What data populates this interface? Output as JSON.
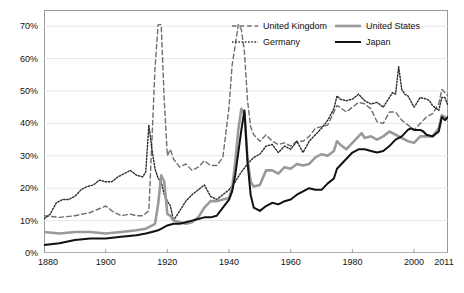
{
  "chart_data": {
    "type": "line",
    "title": "",
    "subtitle": "",
    "xlabel": "",
    "ylabel": "",
    "xlim": [
      1880,
      2011
    ],
    "ylim": [
      0,
      75
    ],
    "grid": false,
    "legend_position": "top-right",
    "xticks": [
      "1880",
      "1900",
      "1920",
      "1940",
      "1960",
      "1980",
      "2000",
      "2011"
    ],
    "xtick_values": [
      1880,
      1900,
      1920,
      1940,
      1960,
      1980,
      2000,
      2011
    ],
    "yticks": [
      "0%",
      "10%",
      "20%",
      "30%",
      "40%",
      "50%",
      "60%",
      "70%"
    ],
    "ytick_values": [
      0,
      10,
      20,
      30,
      40,
      50,
      60,
      70
    ],
    "series": [
      {
        "name": "United Kingdom",
        "color": "#6e6e6e",
        "style": "dashed",
        "width": 1.4,
        "points": [
          [
            1880,
            11.5
          ],
          [
            1885,
            11.0
          ],
          [
            1890,
            11.5
          ],
          [
            1895,
            12.5
          ],
          [
            1900,
            14.5
          ],
          [
            1902,
            13.0
          ],
          [
            1905,
            11.5
          ],
          [
            1908,
            12.0
          ],
          [
            1910,
            11.5
          ],
          [
            1912,
            11.5
          ],
          [
            1914,
            13.0
          ],
          [
            1915,
            35.0
          ],
          [
            1916,
            57.0
          ],
          [
            1917,
            70.5
          ],
          [
            1918,
            70.5
          ],
          [
            1919,
            47.0
          ],
          [
            1920,
            30.0
          ],
          [
            1921,
            32.0
          ],
          [
            1922,
            29.0
          ],
          [
            1924,
            26.5
          ],
          [
            1926,
            27.5
          ],
          [
            1928,
            25.5
          ],
          [
            1930,
            26.5
          ],
          [
            1932,
            28.5
          ],
          [
            1934,
            27.0
          ],
          [
            1936,
            27.0
          ],
          [
            1938,
            29.5
          ],
          [
            1940,
            45.0
          ],
          [
            1941,
            58.0
          ],
          [
            1942,
            64.0
          ],
          [
            1943,
            70.5
          ],
          [
            1944,
            69.0
          ],
          [
            1945,
            62.0
          ],
          [
            1946,
            47.0
          ],
          [
            1947,
            39.0
          ],
          [
            1948,
            36.5
          ],
          [
            1950,
            34.5
          ],
          [
            1952,
            36.5
          ],
          [
            1954,
            34.5
          ],
          [
            1956,
            33.5
          ],
          [
            1958,
            34.0
          ],
          [
            1960,
            33.0
          ],
          [
            1962,
            34.5
          ],
          [
            1964,
            34.5
          ],
          [
            1966,
            36.0
          ],
          [
            1968,
            38.5
          ],
          [
            1970,
            39.0
          ],
          [
            1972,
            39.5
          ],
          [
            1974,
            43.5
          ],
          [
            1975,
            45.5
          ],
          [
            1976,
            45.0
          ],
          [
            1978,
            43.5
          ],
          [
            1980,
            45.0
          ],
          [
            1982,
            46.5
          ],
          [
            1984,
            46.0
          ],
          [
            1986,
            44.5
          ],
          [
            1988,
            40.5
          ],
          [
            1990,
            40.0
          ],
          [
            1992,
            43.5
          ],
          [
            1994,
            43.5
          ],
          [
            1996,
            41.0
          ],
          [
            1998,
            39.5
          ],
          [
            2000,
            38.0
          ],
          [
            2002,
            40.0
          ],
          [
            2004,
            42.0
          ],
          [
            2006,
            43.0
          ],
          [
            2008,
            46.0
          ],
          [
            2009,
            50.5
          ],
          [
            2010,
            49.5
          ],
          [
            2011,
            48.5
          ]
        ]
      },
      {
        "name": "Germany",
        "color": "#2a2a2a",
        "style": "dotted",
        "width": 1.4,
        "points": [
          [
            1880,
            10.5
          ],
          [
            1882,
            12.0
          ],
          [
            1884,
            15.5
          ],
          [
            1886,
            16.5
          ],
          [
            1888,
            16.5
          ],
          [
            1890,
            17.5
          ],
          [
            1892,
            19.5
          ],
          [
            1894,
            20.5
          ],
          [
            1896,
            21.0
          ],
          [
            1898,
            22.5
          ],
          [
            1900,
            22.0
          ],
          [
            1902,
            22.0
          ],
          [
            1904,
            23.5
          ],
          [
            1906,
            24.5
          ],
          [
            1908,
            25.5
          ],
          [
            1910,
            24.0
          ],
          [
            1912,
            23.5
          ],
          [
            1913,
            25.0
          ],
          [
            1914,
            39.5
          ],
          [
            1915,
            32.0
          ],
          [
            1916,
            26.0
          ],
          [
            1917,
            23.0
          ],
          [
            1918,
            22.0
          ],
          [
            1919,
            18.0
          ],
          [
            1920,
            16.0
          ],
          [
            1921,
            14.5
          ],
          [
            1922,
            10.0
          ],
          [
            1924,
            13.0
          ],
          [
            1925,
            14.5
          ],
          [
            1926,
            16.0
          ],
          [
            1928,
            18.0
          ],
          [
            1930,
            19.5
          ],
          [
            1932,
            21.0
          ],
          [
            1934,
            17.5
          ],
          [
            1936,
            16.5
          ],
          [
            1938,
            18.0
          ],
          [
            1940,
            19.5
          ],
          [
            1942,
            22.0
          ],
          [
            1944,
            25.0
          ],
          [
            1946,
            27.5
          ],
          [
            1948,
            29.5
          ],
          [
            1950,
            30.5
          ],
          [
            1952,
            33.0
          ],
          [
            1954,
            33.5
          ],
          [
            1956,
            31.0
          ],
          [
            1958,
            33.0
          ],
          [
            1960,
            32.0
          ],
          [
            1962,
            34.5
          ],
          [
            1964,
            31.0
          ],
          [
            1966,
            34.5
          ],
          [
            1968,
            36.5
          ],
          [
            1970,
            38.5
          ],
          [
            1972,
            41.0
          ],
          [
            1974,
            44.5
          ],
          [
            1975,
            48.5
          ],
          [
            1976,
            47.5
          ],
          [
            1978,
            47.0
          ],
          [
            1980,
            47.5
          ],
          [
            1982,
            49.0
          ],
          [
            1984,
            47.0
          ],
          [
            1986,
            46.0
          ],
          [
            1988,
            46.5
          ],
          [
            1990,
            45.0
          ],
          [
            1992,
            48.0
          ],
          [
            1993,
            49.5
          ],
          [
            1994,
            49.0
          ],
          [
            1995,
            57.5
          ],
          [
            1996,
            50.5
          ],
          [
            1997,
            49.0
          ],
          [
            1998,
            48.5
          ],
          [
            2000,
            45.0
          ],
          [
            2002,
            48.0
          ],
          [
            2004,
            47.5
          ],
          [
            2005,
            47.0
          ],
          [
            2006,
            45.5
          ],
          [
            2008,
            44.0
          ],
          [
            2009,
            48.0
          ],
          [
            2010,
            48.0
          ],
          [
            2011,
            45.5
          ]
        ]
      },
      {
        "name": "United States",
        "color": "#9a9a9a",
        "style": "solid",
        "width": 2.6,
        "points": [
          [
            1880,
            6.5
          ],
          [
            1885,
            6.0
          ],
          [
            1890,
            6.5
          ],
          [
            1895,
            6.5
          ],
          [
            1900,
            6.0
          ],
          [
            1905,
            6.5
          ],
          [
            1910,
            7.0
          ],
          [
            1913,
            7.5
          ],
          [
            1914,
            8.0
          ],
          [
            1916,
            9.0
          ],
          [
            1917,
            15.0
          ],
          [
            1918,
            24.0
          ],
          [
            1919,
            22.0
          ],
          [
            1920,
            12.0
          ],
          [
            1921,
            11.5
          ],
          [
            1922,
            10.0
          ],
          [
            1924,
            9.5
          ],
          [
            1926,
            9.0
          ],
          [
            1928,
            9.5
          ],
          [
            1930,
            11.0
          ],
          [
            1932,
            14.0
          ],
          [
            1934,
            16.0
          ],
          [
            1936,
            16.0
          ],
          [
            1938,
            16.5
          ],
          [
            1940,
            17.0
          ],
          [
            1941,
            20.0
          ],
          [
            1942,
            28.0
          ],
          [
            1943,
            38.0
          ],
          [
            1944,
            44.5
          ],
          [
            1945,
            43.0
          ],
          [
            1946,
            29.0
          ],
          [
            1947,
            22.0
          ],
          [
            1948,
            20.5
          ],
          [
            1950,
            21.0
          ],
          [
            1952,
            25.5
          ],
          [
            1954,
            25.5
          ],
          [
            1956,
            24.5
          ],
          [
            1958,
            26.5
          ],
          [
            1960,
            26.0
          ],
          [
            1962,
            27.5
          ],
          [
            1964,
            27.0
          ],
          [
            1966,
            27.5
          ],
          [
            1968,
            29.5
          ],
          [
            1970,
            30.5
          ],
          [
            1972,
            30.0
          ],
          [
            1974,
            31.5
          ],
          [
            1975,
            34.5
          ],
          [
            1976,
            33.5
          ],
          [
            1978,
            32.0
          ],
          [
            1980,
            34.0
          ],
          [
            1982,
            36.0
          ],
          [
            1983,
            37.0
          ],
          [
            1984,
            35.5
          ],
          [
            1986,
            36.0
          ],
          [
            1988,
            35.0
          ],
          [
            1990,
            36.0
          ],
          [
            1992,
            37.5
          ],
          [
            1994,
            36.5
          ],
          [
            1996,
            35.5
          ],
          [
            1998,
            34.5
          ],
          [
            2000,
            34.0
          ],
          [
            2002,
            36.0
          ],
          [
            2004,
            36.0
          ],
          [
            2006,
            36.0
          ],
          [
            2008,
            38.5
          ],
          [
            2009,
            42.5
          ],
          [
            2010,
            42.0
          ],
          [
            2011,
            41.0
          ]
        ]
      },
      {
        "name": "Japan",
        "color": "#111111",
        "style": "solid",
        "width": 2.0,
        "points": [
          [
            1880,
            2.5
          ],
          [
            1885,
            3.0
          ],
          [
            1890,
            4.0
          ],
          [
            1895,
            4.5
          ],
          [
            1900,
            4.5
          ],
          [
            1905,
            5.0
          ],
          [
            1910,
            5.5
          ],
          [
            1913,
            6.0
          ],
          [
            1915,
            6.5
          ],
          [
            1917,
            7.0
          ],
          [
            1919,
            8.0
          ],
          [
            1920,
            8.5
          ],
          [
            1922,
            9.0
          ],
          [
            1924,
            9.0
          ],
          [
            1926,
            9.5
          ],
          [
            1928,
            10.0
          ],
          [
            1930,
            10.5
          ],
          [
            1932,
            11.0
          ],
          [
            1934,
            11.0
          ],
          [
            1936,
            11.5
          ],
          [
            1938,
            14.0
          ],
          [
            1940,
            16.5
          ],
          [
            1941,
            19.0
          ],
          [
            1942,
            24.0
          ],
          [
            1943,
            31.0
          ],
          [
            1944,
            38.0
          ],
          [
            1945,
            44.0
          ],
          [
            1946,
            28.0
          ],
          [
            1947,
            18.0
          ],
          [
            1948,
            14.0
          ],
          [
            1950,
            13.0
          ],
          [
            1952,
            14.5
          ],
          [
            1954,
            15.5
          ],
          [
            1956,
            15.0
          ],
          [
            1958,
            16.0
          ],
          [
            1960,
            16.5
          ],
          [
            1962,
            18.0
          ],
          [
            1964,
            19.0
          ],
          [
            1966,
            20.0
          ],
          [
            1968,
            19.5
          ],
          [
            1970,
            19.5
          ],
          [
            1972,
            21.5
          ],
          [
            1974,
            23.0
          ],
          [
            1975,
            26.0
          ],
          [
            1976,
            27.0
          ],
          [
            1978,
            29.0
          ],
          [
            1980,
            31.0
          ],
          [
            1982,
            32.0
          ],
          [
            1984,
            32.0
          ],
          [
            1986,
            31.5
          ],
          [
            1988,
            31.0
          ],
          [
            1990,
            31.5
          ],
          [
            1992,
            33.0
          ],
          [
            1994,
            35.0
          ],
          [
            1996,
            36.0
          ],
          [
            1998,
            38.0
          ],
          [
            1999,
            38.5
          ],
          [
            2000,
            38.0
          ],
          [
            2002,
            38.0
          ],
          [
            2003,
            37.5
          ],
          [
            2004,
            36.5
          ],
          [
            2006,
            36.0
          ],
          [
            2008,
            37.5
          ],
          [
            2009,
            42.0
          ],
          [
            2010,
            41.0
          ],
          [
            2011,
            42.0
          ]
        ]
      }
    ]
  },
  "legend": {
    "items": [
      {
        "label": "United Kingdom",
        "style": "dashed",
        "color": "#6e6e6e"
      },
      {
        "label": "United States",
        "style": "solid",
        "color": "#9a9a9a"
      },
      {
        "label": "Germany",
        "style": "dotted",
        "color": "#2a2a2a"
      },
      {
        "label": "Japan",
        "style": "solid",
        "color": "#111111"
      }
    ]
  }
}
